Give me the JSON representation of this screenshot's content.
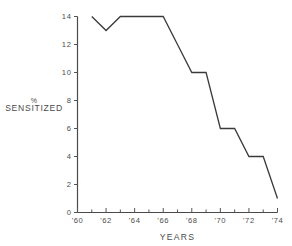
{
  "chart_data": {
    "type": "line",
    "title": "",
    "subtitle": "",
    "xlabel": "YEARS",
    "ylabel": "% SENSITIZED",
    "ylabel_lines": [
      "%",
      "SENSITIZED"
    ],
    "x": [
      1961,
      1962,
      1963,
      1964,
      1965,
      1966,
      1967,
      1968,
      1969,
      1970,
      1971,
      1972,
      1973,
      1974
    ],
    "values": [
      14,
      13,
      14,
      14,
      14,
      14,
      12,
      10,
      10,
      6,
      6,
      4,
      4,
      1
    ],
    "xlim": [
      1960,
      1974
    ],
    "ylim": [
      0,
      14
    ],
    "grid": false,
    "legend": false,
    "legend_position": "none",
    "line_color": "#3a3a3a",
    "axis_color": "#4a4a4a",
    "x_tick_values": [
      1960,
      1961,
      1962,
      1963,
      1964,
      1965,
      1966,
      1967,
      1968,
      1969,
      1970,
      1971,
      1972,
      1973,
      1974
    ],
    "x_tick_labels": [
      "'60",
      "",
      "'62",
      "",
      "'64",
      "",
      "'66",
      "",
      "'68",
      "",
      "'70",
      "",
      "'72",
      "",
      "'74"
    ],
    "y_tick_values": [
      0,
      2,
      4,
      6,
      8,
      10,
      12,
      14
    ],
    "y_tick_labels": [
      "0",
      "2",
      "4",
      "6",
      "8",
      "10",
      "12",
      "14"
    ],
    "series": [
      {
        "name": "% sensitized",
        "points": [
          {
            "x": 1961,
            "y": 14
          },
          {
            "x": 1962,
            "y": 13
          },
          {
            "x": 1963,
            "y": 14
          },
          {
            "x": 1964,
            "y": 14
          },
          {
            "x": 1965,
            "y": 14
          },
          {
            "x": 1966,
            "y": 14
          },
          {
            "x": 1967,
            "y": 12
          },
          {
            "x": 1968,
            "y": 10
          },
          {
            "x": 1969,
            "y": 10
          },
          {
            "x": 1970,
            "y": 6
          },
          {
            "x": 1971,
            "y": 6
          },
          {
            "x": 1972,
            "y": 4
          },
          {
            "x": 1973,
            "y": 4
          },
          {
            "x": 1974,
            "y": 1
          }
        ]
      }
    ]
  }
}
